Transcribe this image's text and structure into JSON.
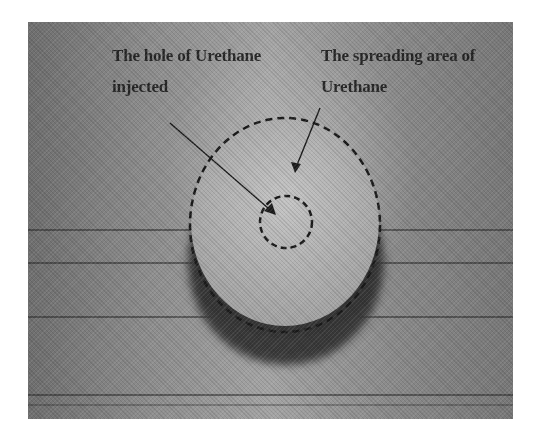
{
  "figure": {
    "labels": {
      "hole": {
        "line1": "The hole of Urethane",
        "line2": "injected"
      },
      "spreading": {
        "line1": "The spreading area of",
        "line2": "Urethane"
      }
    },
    "colors": {
      "annotation": "#1a1a1a",
      "cylinder_top": "#b4b4b4",
      "shadow": "#2a2a2a",
      "background": "#8d8d8d"
    }
  }
}
